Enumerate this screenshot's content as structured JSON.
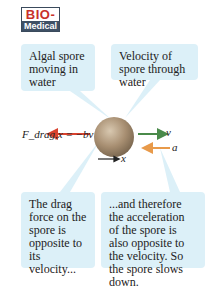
{
  "badge": {
    "top": "BIO-",
    "bottom": "Medical"
  },
  "callouts": [
    {
      "text": "Algal spore moving in water"
    },
    {
      "text": "Velocity of spore through water"
    },
    {
      "text": "The drag force on the spore is opposite to its velocity..."
    },
    {
      "text": "...and therefore the acceleration of the spore is also opposite to the velocity. So the spore slows down."
    }
  ],
  "labels": {
    "drag_force": "F_drag,x = −bv",
    "velocity": "v⃗",
    "acceleration": "a⃗",
    "axis": "x"
  },
  "colors": {
    "drag_arrow": "#d9432f",
    "velocity_arrow": "#4a8a4a",
    "acceleration_arrow": "#e89a4a",
    "axis_arrow": "#222222",
    "spore": "#a88f72",
    "callout_bg": "#dcf0f8"
  }
}
